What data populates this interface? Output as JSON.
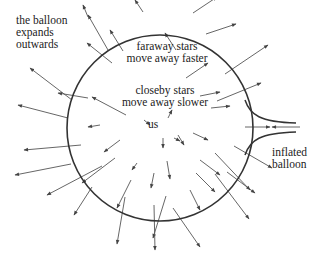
{
  "diagram": {
    "colors": {
      "stroke": "#333333",
      "arrow": "#555555",
      "background": "#ffffff",
      "text": "#222222"
    },
    "balloon": {
      "cx": 160,
      "cy": 128,
      "r": 93
    },
    "nozzle": {
      "upper": "M 245 100 C 250 115, 260 122, 296 123",
      "lower": "M 245 155 C 250 140, 260 133, 296 132"
    },
    "labels": {
      "balloon_expands": [
        "the balloon",
        "expands",
        "outwards"
      ],
      "faraway": [
        "faraway stars",
        "move away faster"
      ],
      "closeby": [
        "closeby stars",
        "move away slower"
      ],
      "us": "us",
      "inflated": [
        "inflated",
        "balloon"
      ]
    },
    "arrows": [
      [
        88,
        17,
        83,
        5
      ],
      [
        108,
        50,
        88,
        15
      ],
      [
        112,
        63,
        87,
        43
      ],
      [
        72,
        100,
        30,
        68
      ],
      [
        88,
        98,
        58,
        93
      ],
      [
        68,
        118,
        18,
        105
      ],
      [
        126,
        115,
        92,
        97
      ],
      [
        123,
        51,
        110,
        30
      ],
      [
        143,
        12,
        135,
        0
      ],
      [
        176,
        50,
        165,
        33
      ],
      [
        193,
        13,
        217,
        -3
      ],
      [
        206,
        34,
        236,
        24
      ],
      [
        186,
        78,
        208,
        63
      ],
      [
        225,
        74,
        268,
        45
      ],
      [
        217,
        101,
        261,
        83
      ],
      [
        200,
        96,
        220,
        92
      ],
      [
        211,
        108,
        230,
        106
      ],
      [
        245,
        127,
        270,
        127
      ],
      [
        100,
        125,
        88,
        127
      ],
      [
        81,
        145,
        24,
        150
      ],
      [
        71,
        164,
        15,
        175
      ],
      [
        120,
        140,
        104,
        152
      ],
      [
        115,
        158,
        82,
        183
      ],
      [
        102,
        166,
        47,
        195
      ],
      [
        137,
        163,
        132,
        170
      ],
      [
        154,
        173,
        151,
        188
      ],
      [
        167,
        161,
        170,
        179
      ],
      [
        131,
        180,
        117,
        208
      ],
      [
        92,
        187,
        74,
        215
      ],
      [
        166,
        196,
        153,
        238
      ],
      [
        125,
        197,
        117,
        244
      ],
      [
        154,
        205,
        155,
        250
      ],
      [
        190,
        190,
        200,
        210
      ],
      [
        173,
        208,
        200,
        247
      ],
      [
        196,
        173,
        215,
        192
      ],
      [
        215,
        174,
        249,
        219
      ],
      [
        227,
        172,
        255,
        193
      ],
      [
        193,
        133,
        208,
        140
      ],
      [
        200,
        160,
        220,
        175
      ],
      [
        178,
        135,
        184,
        145
      ],
      [
        163,
        138,
        163,
        148
      ],
      [
        168,
        118,
        172,
        110
      ],
      [
        174,
        138,
        180,
        141
      ],
      [
        144,
        120,
        150,
        125
      ],
      [
        300,
        127,
        272,
        127
      ],
      [
        234,
        146,
        272,
        168
      ],
      [
        215,
        153,
        250,
        190
      ]
    ]
  }
}
